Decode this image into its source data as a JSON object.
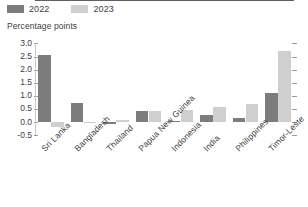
{
  "legend": {
    "items": [
      {
        "label": "2022",
        "color": "#7c7c7c",
        "name": "legend-item-2022"
      },
      {
        "label": "2023",
        "color": "#cfcfcf",
        "name": "legend-item-2023"
      }
    ]
  },
  "axis_title": "Percentage points",
  "chart_data": {
    "type": "bar",
    "title": "",
    "subtitle": "",
    "xlabel": "",
    "ylabel": "Percentage points",
    "ylim": [
      -0.5,
      3.0
    ],
    "yticks": [
      "3.0",
      "2.5",
      "2.0",
      "1.5",
      "1.0",
      "0.5",
      "0.0",
      "-0.5"
    ],
    "ytick_values": [
      3.0,
      2.5,
      2.0,
      1.5,
      1.0,
      0.5,
      0.0,
      -0.5
    ],
    "grid": false,
    "legend_position": "top-left",
    "categories": [
      "Sri Lanka",
      "Bangladesh",
      "Thailand",
      "Papua New Guinea",
      "Indonesia",
      "India",
      "Philippines",
      "Timor-Leste"
    ],
    "series": [
      {
        "name": "2022",
        "color": "#7c7c7c",
        "values": [
          2.55,
          0.71,
          -0.07,
          0.41,
          0.04,
          0.27,
          0.16,
          1.1
        ]
      },
      {
        "name": "2023",
        "color": "#cfcfcf",
        "values": [
          -0.18,
          -0.05,
          0.09,
          0.41,
          0.47,
          0.56,
          0.67,
          2.7
        ]
      }
    ]
  }
}
